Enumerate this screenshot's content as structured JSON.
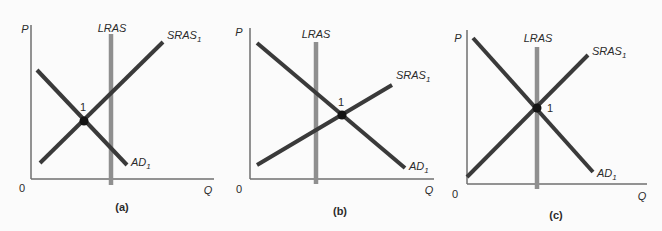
{
  "figure": {
    "colors": {
      "background": "#fbfbfb",
      "axis": "#6f6f6f",
      "lras": "#8f8f8f",
      "curve": "#3a3a3a",
      "dot": "#141414",
      "label_text": "#2b2b2b"
    },
    "panels": [
      {
        "caption": "(a)",
        "p_axis_label": "P",
        "q_axis_label": "Q",
        "origin_label": "0",
        "lras_label": "LRAS",
        "sras_label": "SRAS",
        "sras_sub": "1",
        "ad_label": "AD",
        "ad_sub": "1",
        "point_label": "1",
        "geometry": {
          "y_axis": [
            31,
            25,
            31,
            179
          ],
          "x_axis": [
            31,
            179,
            214,
            179
          ],
          "lras": [
            111,
            34,
            111,
            185
          ],
          "sras": [
            40,
            163,
            163,
            42
          ],
          "ad": [
            37,
            70,
            127,
            165
          ],
          "dot": [
            84,
            121,
            4.5
          ],
          "pos_p": [
            25,
            29
          ],
          "pos_lras": [
            112,
            28
          ],
          "pos_sras": [
            167,
            37
          ],
          "pos_ad": [
            131,
            164
          ],
          "pos_point": [
            83,
            107
          ],
          "pos_origin": [
            22,
            188
          ],
          "pos_q": [
            208,
            190
          ],
          "pos_caption": [
            122,
            207
          ]
        }
      },
      {
        "caption": "(b)",
        "p_axis_label": "P",
        "q_axis_label": "Q",
        "origin_label": "0",
        "lras_label": "LRAS",
        "sras_label": "SRAS",
        "sras_sub": "1",
        "ad_label": "AD",
        "ad_sub": "1",
        "point_label": "1",
        "geometry": {
          "y_axis": [
            25,
            28,
            25,
            179
          ],
          "x_axis": [
            25,
            179,
            209,
            179
          ],
          "lras": [
            91,
            42,
            91,
            184
          ],
          "sras": [
            32,
            165,
            167,
            85
          ],
          "ad": [
            32,
            43,
            180,
            168
          ],
          "dot": [
            117,
            115,
            4.5
          ],
          "pos_p": [
            14,
            32
          ],
          "pos_lras": [
            91,
            34
          ],
          "pos_sras": [
            171,
            77
          ],
          "pos_ad": [
            184,
            168
          ],
          "pos_point": [
            116,
            102
          ],
          "pos_origin": [
            14,
            189
          ],
          "pos_q": [
            204,
            190
          ],
          "pos_caption": [
            115,
            211
          ]
        }
      },
      {
        "caption": "(c)",
        "p_axis_label": "P",
        "q_axis_label": "Q",
        "origin_label": "0",
        "lras_label": "LRAS",
        "sras_label": "SRAS",
        "sras_sub": "1",
        "ad_label": "AD",
        "ad_sub": "1",
        "point_label": "1",
        "geometry": {
          "y_axis": [
            27,
            30,
            27,
            184
          ],
          "x_axis": [
            27,
            184,
            207,
            184
          ],
          "lras": [
            97,
            47,
            97,
            189
          ],
          "sras": [
            27,
            177,
            148,
            55
          ],
          "ad": [
            33,
            38,
            153,
            172
          ],
          "dot": [
            97,
            108,
            4.5
          ],
          "pos_p": [
            18,
            38
          ],
          "pos_lras": [
            98,
            38
          ],
          "pos_sras": [
            152,
            53
          ],
          "pos_ad": [
            157,
            175
          ],
          "pos_point": [
            110,
            108
          ],
          "pos_origin": [
            15,
            194
          ],
          "pos_q": [
            202,
            196
          ],
          "pos_caption": [
            116,
            215
          ]
        }
      }
    ]
  }
}
